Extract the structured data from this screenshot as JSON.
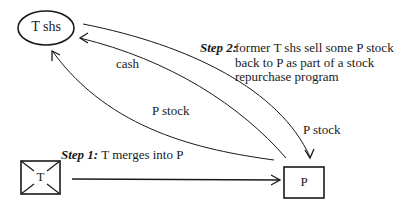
{
  "nodes": {
    "t_shareholders": {
      "label": "T shs",
      "shape": "ellipse"
    },
    "t_company": {
      "label": "T",
      "shape": "crossed-box"
    },
    "p_company": {
      "label": "P",
      "shape": "box"
    }
  },
  "edges": {
    "merger": {
      "from": "T",
      "to": "P"
    },
    "p_stock_to_t_shs": {
      "label": "P stock",
      "from": "P",
      "to": "T shs"
    },
    "cash_to_t_shs": {
      "label": "cash",
      "from": "P",
      "to": "T shs"
    },
    "p_stock_back_to_p": {
      "label": "P stock",
      "from": "T shs",
      "to": "P"
    }
  },
  "steps": {
    "step1": {
      "prefix": "Step 1:",
      "text": "T merges into P"
    },
    "step2": {
      "prefix": "Step 2:",
      "lines": [
        "former T shs sell some P stock",
        "back to P as part of a stock",
        "repurchase program"
      ]
    }
  },
  "colors": {
    "stroke": "#1a1a1a",
    "background": "#ffffff"
  }
}
